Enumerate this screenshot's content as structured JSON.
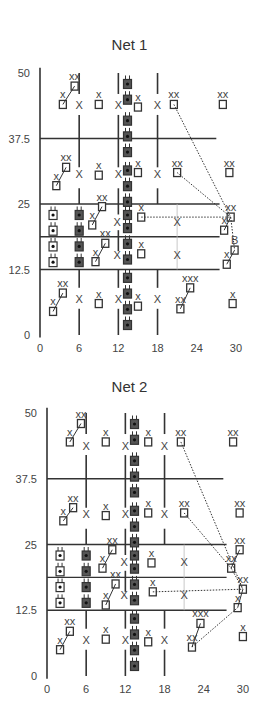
{
  "figure": {
    "panels": [
      {
        "title": "Net 1",
        "y_ticks": [
          "50",
          "37.5",
          "25",
          "12.5",
          "0"
        ],
        "x_ticks": [
          "0",
          "6",
          "12",
          "18",
          "24",
          "30"
        ]
      },
      {
        "title": "Net 2",
        "y_ticks": [
          "50",
          "37.5",
          "25",
          "12.5",
          "0"
        ],
        "x_ticks": [
          "0",
          "6",
          "12",
          "18",
          "24",
          "30"
        ]
      }
    ],
    "labels": {
      "x": "x",
      "xx": "xx",
      "xxx": "xxx",
      "cross": "X"
    },
    "legend_symbols": {
      "square": "trap / sampling point",
      "cross": "X marker",
      "plug": "dark device symbol",
      "dotted": "movement path"
    }
  }
}
